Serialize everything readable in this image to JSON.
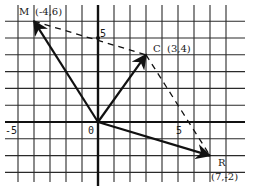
{
  "diagram": {
    "type": "coordinate-plane-vectors",
    "grid": {
      "origin_px": [
        98,
        122
      ],
      "unit_x_px": 16,
      "unit_y_px": 16.8,
      "x_range": [
        -5,
        8
      ],
      "y_range": [
        -3,
        7
      ],
      "grid_color": "#2a2a2a",
      "axis_color": "#111111"
    },
    "axis_labels": {
      "origin": "0",
      "x_neg5": "-5",
      "x_5": "5",
      "y_5": "5"
    },
    "points": [
      {
        "id": "M",
        "name": "M",
        "coords_label": "(-4,6)",
        "x": -4,
        "y": 6
      },
      {
        "id": "C",
        "name": "C",
        "coords_label": "(3,4)",
        "x": 3,
        "y": 4
      },
      {
        "id": "R",
        "name": "R",
        "coords_label": "(7,-2)",
        "x": 7,
        "y": -2
      }
    ],
    "vectors": [
      {
        "from": "O",
        "to": "M",
        "style": "solid"
      },
      {
        "from": "O",
        "to": "C",
        "style": "solid"
      },
      {
        "from": "O",
        "to": "R",
        "style": "solid"
      }
    ],
    "dashed_segments": [
      {
        "from": "M",
        "to": "C"
      },
      {
        "from": "C",
        "to": "R"
      }
    ]
  }
}
